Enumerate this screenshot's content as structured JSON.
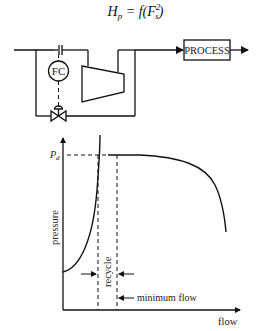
{
  "equation": {
    "lhs": "H",
    "lhs_sub": "p",
    "rhs_prefix": " = f(F",
    "rhs_sup": "2",
    "rhs_sub": "s",
    "rhs_suffix": ")"
  },
  "schematic": {
    "controller_label": "FC",
    "process_label": "PROCESS"
  },
  "graph": {
    "y_axis_label": "pressure",
    "x_axis_label": "flow",
    "pd_label": "P",
    "pd_sub": "d",
    "recycle_label": "recycle",
    "minimum_flow_label": "minimum flow"
  },
  "colors": {
    "line": "#111111",
    "background": "#ffffff"
  }
}
